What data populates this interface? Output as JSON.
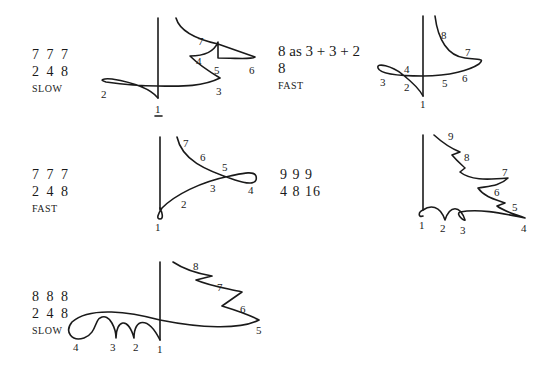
{
  "patterns": [
    {
      "id": "p1",
      "line1": "7 7 7",
      "line2": "2 4 8",
      "tempo": "SLOW",
      "beats": [
        "1",
        "2",
        "3",
        "4",
        "5",
        "6",
        "7"
      ]
    },
    {
      "id": "p2",
      "line1": "8 as 3 + 3 + 2",
      "line2": "8",
      "tempo": "FAST",
      "beats": [
        "1",
        "2",
        "3",
        "4",
        "5",
        "6",
        "7",
        "8"
      ]
    },
    {
      "id": "p3",
      "line1": "7 7 7",
      "line2": "2 4 8",
      "tempo": "FAST",
      "beats": [
        "1",
        "2",
        "3",
        "4",
        "5",
        "6",
        "7"
      ]
    },
    {
      "id": "p4",
      "line1": "9 9 9",
      "line2": "4 8 16",
      "tempo": "",
      "beats": [
        "1",
        "2",
        "3",
        "4",
        "5",
        "6",
        "7",
        "8",
        "9"
      ]
    },
    {
      "id": "p5",
      "line1": "8 8 8",
      "line2": "2 4 8",
      "tempo": "SLOW",
      "beats": [
        "1",
        "2",
        "3",
        "4",
        "5",
        "6",
        "7",
        "8"
      ]
    }
  ]
}
